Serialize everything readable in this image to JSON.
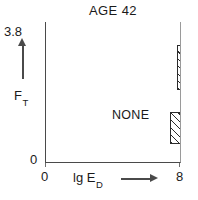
{
  "chart_data": {
    "type": "area",
    "title": "AGE 42",
    "xlabel": "lg E_D",
    "xlabel_main": "lg E",
    "xlabel_sub": "D",
    "ylabel": "F_T",
    "ylabel_main": "F",
    "ylabel_sub": "T",
    "xlim": [
      0,
      8
    ],
    "ylim": [
      0,
      3.8
    ],
    "xticks": [
      "0",
      "8"
    ],
    "yticks": [
      "0",
      "3.8"
    ],
    "grid": false,
    "legend": "none",
    "x_axis_arrow": true,
    "y_axis_arrow": true,
    "regions": [
      {
        "name": "NONE",
        "label": "NONE",
        "fill": "plain",
        "description": "unhatched region occupying the lower-left majority of the plot"
      },
      {
        "name": "SPRAY",
        "label": "SPRAY",
        "label_letters": [
          "S",
          "P",
          "R",
          "A",
          "Y"
        ],
        "label_orientation": "vertical-stacked",
        "fill": "diagonal-hatch",
        "hatch_angle_deg": 45,
        "boundary_type": "stepped",
        "blocks": [
          {
            "x_start": 6.3,
            "x_end": 8.0,
            "y_start": 2.66,
            "y_end": 3.8
          },
          {
            "x_start": 7.0,
            "x_end": 8.0,
            "y_start": 2.02,
            "y_end": 2.66
          },
          {
            "x_start": 5.9,
            "x_end": 8.0,
            "y_start": 1.16,
            "y_end": 2.02
          }
        ],
        "description": "hatched staircase region along the right edge of the plot"
      }
    ],
    "colors": {
      "line": "#2b2b2b",
      "axis": "#4a4a4a",
      "frame": "#8c8c8c",
      "background": "#ffffff",
      "hatch": "#2b2b2b"
    }
  }
}
